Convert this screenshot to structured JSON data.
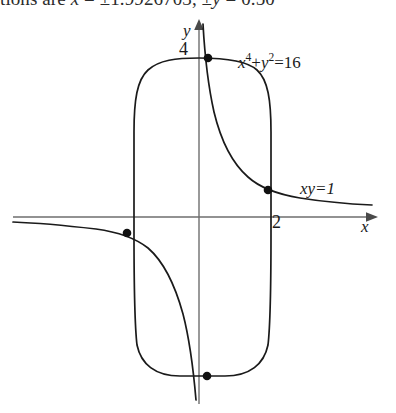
{
  "page_text_fragment": {
    "prefix": "tions are ",
    "var_x": "x",
    "eq1": " = ±1.9926703, ",
    "var_y": "±y",
    "eq2": " = 0.50"
  },
  "figure": {
    "axes": {
      "x_axis_label": "x",
      "y_axis_label": "y",
      "x_tick_label": "2",
      "y_tick_label": "4"
    },
    "curves": [
      {
        "name": "quartic-oval",
        "label_base": "x",
        "label_exp1": "4",
        "label_plus": "+",
        "label_base2": "y",
        "label_exp2": "2",
        "label_rhs": "=16",
        "equation_text": "x^4+y^2=16",
        "color": "#1a1a1a"
      },
      {
        "name": "hyperbola",
        "label": "xy=1",
        "equation_text": "xy=1",
        "color": "#1a1a1a"
      }
    ],
    "intersection_points": [
      {
        "name": "top",
        "x": 208,
        "y": 58
      },
      {
        "name": "right",
        "x": 268,
        "y": 190
      },
      {
        "name": "left",
        "x": 127,
        "y": 233
      },
      {
        "name": "bottom",
        "x": 207,
        "y": 376
      }
    ],
    "colors": {
      "curve": "#1a1a1a",
      "axis": "#6b6b6b",
      "point": "#111111",
      "background": "#ffffff"
    }
  }
}
